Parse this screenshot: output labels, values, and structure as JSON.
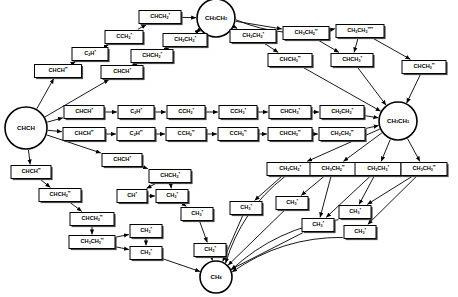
{
  "diagram": {
    "type": "directed-graph",
    "width": 458,
    "height": 297,
    "colors": {
      "node_fill": "#ffffff",
      "node_stroke": "#000000",
      "edge": "#000000",
      "shadow": "#4a4a4a"
    },
    "nodes": [
      {
        "id": "chch",
        "shape": "circle",
        "x": 26,
        "y": 128,
        "r": 21,
        "base": "CHCH",
        "sub1": "",
        "stars": 0,
        "label": "CHCH"
      },
      {
        "id": "ch3ch3_top",
        "shape": "circle",
        "x": 216,
        "y": 18,
        "r": 19,
        "base": "CH",
        "sub1": "3",
        "base2": "CH",
        "sub2": "3",
        "stars": 0,
        "label": "CH3CH3"
      },
      {
        "id": "ch3ch3_right",
        "shape": "circle",
        "x": 398,
        "y": 121,
        "r": 19,
        "base": "CH",
        "sub1": "3",
        "base2": "CH",
        "sub2": "3",
        "stars": 0,
        "label": "CH3CH3"
      },
      {
        "id": "ch4",
        "shape": "circle",
        "x": 216,
        "y": 277,
        "r": 16,
        "base": "CH",
        "sub1": "4",
        "stars": 0,
        "label": "CH4"
      },
      {
        "id": "chch_ss_a",
        "shape": "box",
        "x": 58,
        "y": 71,
        "w": 47,
        "h": 13,
        "base": "CHCH",
        "sub1": "",
        "stars": 2,
        "label": "CHCH**"
      },
      {
        "id": "c2h_s",
        "shape": "box",
        "x": 90,
        "y": 54,
        "w": 36,
        "h": 13,
        "base": "C",
        "sub1": "2",
        "base2": "H",
        "stars": 1,
        "label": "C2H*"
      },
      {
        "id": "cch2_s",
        "shape": "box",
        "x": 124,
        "y": 37,
        "w": 38,
        "h": 13,
        "base": "CCH",
        "sub1": "2",
        "stars": 1,
        "label": "CCH2*"
      },
      {
        "id": "chch2_s_top",
        "shape": "box",
        "x": 160,
        "y": 17,
        "w": 42,
        "h": 13,
        "base": "CHCH",
        "sub1": "2",
        "stars": 1,
        "label": "CHCH2*"
      },
      {
        "id": "chch_s_b",
        "shape": "box",
        "x": 122,
        "y": 72,
        "w": 42,
        "h": 13,
        "base": "CHCH",
        "sub1": "",
        "stars": 1,
        "label": "CHCH*"
      },
      {
        "id": "chch2_s_mid",
        "shape": "box",
        "x": 152,
        "y": 56,
        "w": 42,
        "h": 13,
        "base": "CHCH",
        "sub1": "2",
        "stars": 1,
        "label": "CHCH2*"
      },
      {
        "id": "ch2ch2_s",
        "shape": "box",
        "x": 185,
        "y": 40,
        "w": 44,
        "h": 13,
        "base": "CH",
        "sub1": "2",
        "base2": "CH",
        "sub2": "2",
        "stars": 1,
        "label": "CH2CH2*"
      },
      {
        "id": "chch_s_r1",
        "shape": "box",
        "x": 84,
        "y": 112,
        "w": 40,
        "h": 13,
        "base": "CHCH",
        "sub1": "",
        "stars": 1,
        "label": "CHCH*"
      },
      {
        "id": "c2h_s_r1",
        "shape": "box",
        "x": 136,
        "y": 112,
        "w": 36,
        "h": 13,
        "base": "C",
        "sub1": "2",
        "base2": "H",
        "stars": 1,
        "label": "C2H*"
      },
      {
        "id": "cch2_s_r1",
        "shape": "box",
        "x": 186,
        "y": 112,
        "w": 38,
        "h": 13,
        "base": "CCH",
        "sub1": "2",
        "stars": 1,
        "label": "CCH2*"
      },
      {
        "id": "cch3_s_r1",
        "shape": "box",
        "x": 238,
        "y": 112,
        "w": 38,
        "h": 13,
        "base": "CCH",
        "sub1": "3",
        "stars": 1,
        "label": "CCH3*"
      },
      {
        "id": "chch3_s_r1",
        "shape": "box",
        "x": 290,
        "y": 112,
        "w": 42,
        "h": 13,
        "base": "CHCH",
        "sub1": "3",
        "stars": 1,
        "label": "CHCH3*"
      },
      {
        "id": "ch2ch3_s_r1",
        "shape": "box",
        "x": 342,
        "y": 112,
        "w": 44,
        "h": 13,
        "base": "CH",
        "sub1": "2",
        "base2": "CH",
        "sub2": "3",
        "stars": 1,
        "label": "CH2CH3*"
      },
      {
        "id": "chch_ss_r2",
        "shape": "box",
        "x": 84,
        "y": 134,
        "w": 42,
        "h": 13,
        "base": "CHCH",
        "sub1": "",
        "stars": 2,
        "label": "CHCH**"
      },
      {
        "id": "c2h_ss_r2",
        "shape": "box",
        "x": 136,
        "y": 134,
        "w": 38,
        "h": 13,
        "base": "C",
        "sub1": "2",
        "base2": "H",
        "stars": 2,
        "label": "C2H**"
      },
      {
        "id": "cch2_ss_r2",
        "shape": "box",
        "x": 186,
        "y": 134,
        "w": 40,
        "h": 13,
        "base": "CCH",
        "sub1": "2",
        "stars": 2,
        "label": "CCH2**"
      },
      {
        "id": "cch3_ss_r2",
        "shape": "box",
        "x": 238,
        "y": 134,
        "w": 40,
        "h": 13,
        "base": "CCH",
        "sub1": "3",
        "stars": 2,
        "label": "CCH3**"
      },
      {
        "id": "chch3_ss_r2",
        "shape": "box",
        "x": 290,
        "y": 134,
        "w": 44,
        "h": 13,
        "base": "CHCH",
        "sub1": "3",
        "stars": 2,
        "label": "CHCH3**"
      },
      {
        "id": "ch2ch3_ss_r2",
        "shape": "box",
        "x": 342,
        "y": 134,
        "w": 46,
        "h": 13,
        "base": "CH",
        "sub1": "2",
        "base2": "CH",
        "sub2": "3",
        "stars": 2,
        "label": "CH2CH3**"
      },
      {
        "id": "ch2ch3_s_tr",
        "shape": "box",
        "x": 253,
        "y": 36,
        "w": 46,
        "h": 13,
        "base": "CH",
        "sub1": "3",
        "base2": "CH",
        "sub2": "2",
        "stars": 1,
        "label": "CH3CH2*"
      },
      {
        "id": "ch3ch2_ss_tr",
        "shape": "box",
        "x": 306,
        "y": 33,
        "w": 46,
        "h": 13,
        "base": "CH",
        "sub1": "3",
        "base2": "CH",
        "sub2": "2",
        "stars": 2,
        "label": "CH3CH2**"
      },
      {
        "id": "ch3ch3_ssss",
        "shape": "box",
        "x": 360,
        "y": 31,
        "w": 48,
        "h": 13,
        "base": "CH",
        "sub1": "3",
        "base2": "CH",
        "sub2": "3",
        "stars": 4,
        "label": "CH3CH3****"
      },
      {
        "id": "chch3_ss_tr",
        "shape": "box",
        "x": 290,
        "y": 60,
        "w": 44,
        "h": 13,
        "base": "CHCH",
        "sub1": "3",
        "stars": 2,
        "label": "CHCH3**"
      },
      {
        "id": "chch3_s_tr",
        "shape": "box",
        "x": 352,
        "y": 60,
        "w": 42,
        "h": 13,
        "base": "CHCH",
        "sub1": "3",
        "stars": 1,
        "label": "CHCH3*"
      },
      {
        "id": "chch3_ss_far",
        "shape": "box",
        "x": 424,
        "y": 67,
        "w": 44,
        "h": 13,
        "base": "CHCH",
        "sub1": "3",
        "stars": 2,
        "label": "CHCH3**"
      },
      {
        "id": "chch_s_low",
        "shape": "box",
        "x": 31,
        "y": 172,
        "w": 40,
        "h": 13,
        "base": "CHCH",
        "sub1": "",
        "stars": 2,
        "label": "CHCH**"
      },
      {
        "id": "chch2_ss_l1",
        "shape": "box",
        "x": 60,
        "y": 195,
        "w": 42,
        "h": 13,
        "base": "CHCH",
        "sub1": "2",
        "stars": 2,
        "label": "CHCH2**"
      },
      {
        "id": "chch3_ss_l2",
        "shape": "box",
        "x": 92,
        "y": 219,
        "w": 44,
        "h": 13,
        "base": "CHCH",
        "sub1": "3",
        "stars": 2,
        "label": "CHCH3**"
      },
      {
        "id": "ch3ch3_ss_l3",
        "shape": "box",
        "x": 92,
        "y": 242,
        "w": 46,
        "h": 13,
        "base": "CH",
        "sub1": "3",
        "base2": "CH",
        "sub2": "3",
        "stars": 2,
        "label": "CH3CH3**"
      },
      {
        "id": "chch_s_mid",
        "shape": "box",
        "x": 122,
        "y": 160,
        "w": 40,
        "h": 13,
        "base": "CHCH",
        "sub1": "",
        "stars": 1,
        "label": "CHCH*"
      },
      {
        "id": "chch2_s_low",
        "shape": "box",
        "x": 170,
        "y": 176,
        "w": 42,
        "h": 13,
        "base": "CHCH",
        "sub1": "2",
        "stars": 1,
        "label": "CHCH2*"
      },
      {
        "id": "ch_s",
        "shape": "box",
        "x": 132,
        "y": 196,
        "w": 30,
        "h": 13,
        "base": "CH",
        "sub1": "",
        "stars": 1,
        "label": "CH*"
      },
      {
        "id": "ch2_s_a",
        "shape": "box",
        "x": 172,
        "y": 196,
        "w": 32,
        "h": 13,
        "base": "CH",
        "sub1": "2",
        "stars": 1,
        "label": "CH2*"
      },
      {
        "id": "ch3_s_a",
        "shape": "box",
        "x": 197,
        "y": 214,
        "w": 32,
        "h": 13,
        "base": "CH",
        "sub1": "3",
        "stars": 1,
        "label": "CH3*"
      },
      {
        "id": "ch3_s_b",
        "shape": "box",
        "x": 146,
        "y": 231,
        "w": 32,
        "h": 13,
        "base": "CH",
        "sub1": "3",
        "stars": 1,
        "label": "CH3*"
      },
      {
        "id": "ch3_s_c",
        "shape": "box",
        "x": 146,
        "y": 253,
        "w": 32,
        "h": 13,
        "base": "CH",
        "sub1": "3",
        "stars": 1,
        "label": "CH3*"
      },
      {
        "id": "ch2_s_d",
        "shape": "box",
        "x": 210,
        "y": 250,
        "w": 32,
        "h": 13,
        "base": "CH",
        "sub1": "2",
        "stars": 1,
        "label": "CH2*"
      },
      {
        "id": "ch3ch2_s_br1",
        "shape": "box",
        "x": 290,
        "y": 169,
        "w": 46,
        "h": 13,
        "base": "CH",
        "sub1": "3",
        "base2": "CH",
        "sub2": "2",
        "stars": 1,
        "label": "CH3CH2*"
      },
      {
        "id": "ch3ch2_ss_br",
        "shape": "box",
        "x": 333,
        "y": 169,
        "w": 46,
        "h": 13,
        "base": "CH",
        "sub1": "3",
        "base2": "CH",
        "sub2": "2",
        "stars": 2,
        "label": "CH3CH2**"
      },
      {
        "id": "ch3ch3_s_br",
        "shape": "box",
        "x": 378,
        "y": 169,
        "w": 46,
        "h": 13,
        "base": "CH",
        "sub1": "3",
        "base2": "CH",
        "sub2": "3",
        "stars": 1,
        "label": "CH3CH3*"
      },
      {
        "id": "ch3ch3_ss_br",
        "shape": "box",
        "x": 424,
        "y": 169,
        "w": 46,
        "h": 13,
        "base": "CH",
        "sub1": "3",
        "base2": "CH",
        "sub2": "3",
        "stars": 2,
        "label": "CH3CH3**"
      },
      {
        "id": "ch3_s_br1",
        "shape": "box",
        "x": 246,
        "y": 208,
        "w": 32,
        "h": 13,
        "base": "CH",
        "sub1": "3",
        "stars": 1,
        "label": "CH3*"
      },
      {
        "id": "ch3_s_br2",
        "shape": "box",
        "x": 292,
        "y": 203,
        "w": 32,
        "h": 13,
        "base": "CH",
        "sub1": "3",
        "stars": 1,
        "label": "CH3*"
      },
      {
        "id": "ch3_s_br3",
        "shape": "box",
        "x": 318,
        "y": 225,
        "w": 32,
        "h": 13,
        "base": "CH",
        "sub1": "3",
        "stars": 1,
        "label": "CH3*"
      },
      {
        "id": "ch3_s_br4",
        "shape": "box",
        "x": 355,
        "y": 212,
        "w": 32,
        "h": 13,
        "base": "CH",
        "sub1": "3",
        "stars": 1,
        "label": "CH3*"
      },
      {
        "id": "ch3_s_br5",
        "shape": "box",
        "x": 360,
        "y": 232,
        "w": 32,
        "h": 13,
        "base": "CH",
        "sub1": "3",
        "stars": 1,
        "label": "CH3*"
      }
    ],
    "edges": [
      {
        "from": "chch",
        "to": "chch_ss_a"
      },
      {
        "from": "chch",
        "to": "chch_s_b"
      },
      {
        "from": "chch",
        "to": "chch_s_r1"
      },
      {
        "from": "chch",
        "to": "chch_ss_r2"
      },
      {
        "from": "chch",
        "to": "chch_s_mid"
      },
      {
        "from": "chch",
        "to": "chch_s_low"
      },
      {
        "from": "chch_ss_a",
        "to": "c2h_s"
      },
      {
        "from": "c2h_s",
        "to": "cch2_s"
      },
      {
        "from": "cch2_s",
        "to": "chch2_s_top"
      },
      {
        "from": "chch2_s_top",
        "to": "ch3ch3_top"
      },
      {
        "from": "chch_s_b",
        "to": "chch2_s_mid"
      },
      {
        "from": "chch2_s_mid",
        "to": "ch2ch2_s"
      },
      {
        "from": "ch2ch2_s",
        "to": "ch3ch3_top"
      },
      {
        "from": "chch_s_r1",
        "to": "c2h_s_r1"
      },
      {
        "from": "c2h_s_r1",
        "to": "cch2_s_r1"
      },
      {
        "from": "cch2_s_r1",
        "to": "cch3_s_r1"
      },
      {
        "from": "cch3_s_r1",
        "to": "chch3_s_r1"
      },
      {
        "from": "chch3_s_r1",
        "to": "ch2ch3_s_r1"
      },
      {
        "from": "ch2ch3_s_r1",
        "to": "ch3ch3_right"
      },
      {
        "from": "chch_ss_r2",
        "to": "c2h_ss_r2"
      },
      {
        "from": "c2h_ss_r2",
        "to": "cch2_ss_r2"
      },
      {
        "from": "cch2_ss_r2",
        "to": "cch3_ss_r2"
      },
      {
        "from": "cch3_ss_r2",
        "to": "chch3_ss_r2"
      },
      {
        "from": "chch3_ss_r2",
        "to": "ch2ch3_ss_r2"
      },
      {
        "from": "ch2ch3_ss_r2",
        "to": "ch3ch3_right"
      },
      {
        "from": "ch3ch3_top",
        "to": "ch2ch3_s_tr"
      },
      {
        "from": "ch3ch3_top",
        "to": "ch3ch2_ss_tr"
      },
      {
        "from": "ch3ch3_top",
        "to": "ch3ch3_ssss"
      },
      {
        "from": "ch3ch3_top",
        "to": "ch2ch2_s"
      },
      {
        "from": "ch2ch3_s_tr",
        "to": "chch3_ss_tr"
      },
      {
        "from": "ch3ch2_ss_tr",
        "to": "chch3_s_tr"
      },
      {
        "from": "ch3ch3_ssss",
        "to": "chch3_s_tr"
      },
      {
        "from": "ch3ch3_ssss",
        "to": "chch3_ss_far"
      },
      {
        "from": "chch3_ss_tr",
        "to": "ch3ch3_right"
      },
      {
        "from": "chch3_s_tr",
        "to": "ch3ch3_right"
      },
      {
        "from": "chch3_ss_far",
        "to": "ch3ch3_right"
      },
      {
        "from": "chch_s_low",
        "to": "chch2_ss_l1"
      },
      {
        "from": "chch2_ss_l1",
        "to": "chch3_ss_l2"
      },
      {
        "from": "chch3_ss_l2",
        "to": "ch3ch3_ss_l3"
      },
      {
        "from": "ch3ch3_ss_l3",
        "to": "ch3_s_b"
      },
      {
        "from": "ch3ch3_ss_l3",
        "to": "ch3_s_c"
      },
      {
        "from": "ch3_s_b",
        "to": "ch3_s_c"
      },
      {
        "from": "ch3_s_c",
        "to": "ch4"
      },
      {
        "from": "chch_s_mid",
        "to": "chch2_s_low"
      },
      {
        "from": "chch2_s_low",
        "to": "ch_s"
      },
      {
        "from": "chch2_s_low",
        "to": "ch2_s_a"
      },
      {
        "from": "ch_s",
        "to": "ch2_s_a"
      },
      {
        "from": "ch2_s_a",
        "to": "ch3_s_a"
      },
      {
        "from": "ch3_s_a",
        "to": "ch2_s_d"
      },
      {
        "from": "ch2_s_d",
        "to": "ch4"
      },
      {
        "from": "ch3ch3_right",
        "to": "ch3ch2_s_br1"
      },
      {
        "from": "ch3ch3_right",
        "to": "ch3ch2_ss_br"
      },
      {
        "from": "ch3ch3_right",
        "to": "ch3ch3_s_br"
      },
      {
        "from": "ch3ch3_right",
        "to": "ch3ch3_ss_br"
      },
      {
        "from": "ch3ch2_s_br1",
        "to": "ch3_s_br1"
      },
      {
        "from": "ch3ch2_s_br1",
        "to": "ch4"
      },
      {
        "from": "ch3ch2_ss_br",
        "to": "ch3_s_br2"
      },
      {
        "from": "ch3ch2_ss_br",
        "to": "ch3_s_br3"
      },
      {
        "from": "ch3ch3_s_br",
        "to": "ch3_s_br3"
      },
      {
        "from": "ch3ch3_s_br",
        "to": "ch3_s_br4"
      },
      {
        "from": "ch3ch3_ss_br",
        "to": "ch3_s_br4"
      },
      {
        "from": "ch3ch3_ss_br",
        "to": "ch3_s_br5"
      },
      {
        "from": "ch3_s_br1",
        "to": "ch4"
      },
      {
        "from": "ch3_s_br2",
        "to": "ch4"
      },
      {
        "from": "ch3_s_br3",
        "to": "ch4"
      },
      {
        "from": "ch3_s_br4",
        "to": "ch4"
      },
      {
        "from": "ch3_s_br5",
        "to": "ch4"
      }
    ]
  }
}
